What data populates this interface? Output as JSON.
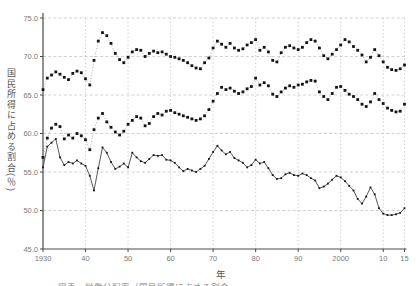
{
  "chart_data": {
    "type": "line",
    "title": "",
    "ylabel": "国民所得に占める割合(％)",
    "xlabel": "年",
    "ylim": [
      45.0,
      75.0
    ],
    "xlim": [
      1930,
      2015
    ],
    "grid": true,
    "legend_position": "none",
    "y_tick_labels": [
      "75.0",
      "70.0",
      "65.0",
      "60.0",
      "55.0",
      "50.0",
      "45.0"
    ],
    "y_tick_values": [
      75,
      70,
      65,
      60,
      55,
      50,
      45
    ],
    "x_tick_labels": [
      "1930",
      "40",
      "50",
      "60",
      "70",
      "80",
      "90",
      "2000",
      "10",
      "15"
    ],
    "x_tick_values": [
      1930,
      1940,
      1950,
      1960,
      1970,
      1980,
      1990,
      2000,
      2010,
      2015
    ],
    "x_start": 1930,
    "x_step": 1,
    "series": [
      {
        "name": "series-top",
        "marker": "square",
        "marker_size": 2.8,
        "line_style": "dotted",
        "values": [
          65.7,
          67.2,
          67.6,
          68.0,
          67.7,
          67.3,
          67.0,
          67.8,
          68.1,
          67.9,
          67.1,
          66.3,
          69.5,
          72.0,
          73.1,
          72.7,
          71.7,
          70.4,
          69.6,
          69.2,
          69.9,
          70.6,
          70.9,
          70.8,
          70.0,
          70.4,
          70.7,
          70.5,
          70.6,
          70.3,
          70.0,
          69.9,
          69.7,
          69.5,
          69.2,
          68.8,
          68.5,
          68.4,
          69.2,
          69.8,
          71.1,
          72.0,
          71.6,
          71.2,
          71.7,
          71.1,
          70.8,
          71.0,
          71.5,
          71.8,
          72.2,
          70.8,
          71.2,
          70.6,
          69.5,
          69.3,
          70.5,
          71.2,
          71.4,
          71.1,
          70.9,
          71.2,
          71.8,
          72.2,
          72.0,
          71.1,
          70.1,
          69.7,
          70.3,
          70.9,
          71.5,
          72.2,
          71.9,
          71.3,
          70.8,
          70.2,
          69.3,
          69.9,
          70.9,
          70.1,
          69.3,
          68.6,
          68.3,
          68.2,
          68.4,
          68.9
        ]
      },
      {
        "name": "series-middle",
        "marker": "square",
        "marker_size": 2.8,
        "line_style": "dotted",
        "values": [
          56.9,
          59.4,
          60.7,
          61.2,
          60.9,
          59.3,
          59.8,
          59.4,
          60.0,
          59.7,
          59.2,
          57.9,
          60.5,
          62.0,
          62.6,
          61.5,
          60.8,
          60.2,
          59.8,
          60.3,
          61.2,
          61.7,
          62.2,
          62.0,
          61.0,
          61.3,
          62.2,
          62.6,
          62.4,
          62.9,
          63.0,
          62.7,
          62.5,
          62.3,
          62.1,
          61.9,
          61.7,
          61.9,
          62.3,
          63.1,
          64.2,
          65.2,
          66.0,
          65.7,
          65.9,
          65.5,
          65.2,
          65.4,
          65.8,
          66.1,
          67.2,
          66.3,
          66.6,
          66.2,
          65.1,
          64.8,
          65.4,
          65.9,
          66.2,
          66.0,
          66.3,
          66.4,
          66.7,
          66.9,
          66.8,
          65.4,
          64.8,
          64.4,
          65.2,
          66.0,
          66.1,
          65.6,
          65.1,
          64.8,
          64.4,
          63.8,
          63.5,
          64.1,
          65.2,
          64.4,
          63.9,
          63.3,
          63.0,
          62.8,
          62.9,
          63.8
        ]
      },
      {
        "name": "series-bottom",
        "marker": "square",
        "marker_size": 1.8,
        "line_style": "solid",
        "values": [
          55.6,
          58.3,
          58.8,
          59.3,
          56.9,
          55.9,
          56.3,
          56.1,
          56.5,
          56.1,
          55.8,
          54.5,
          52.6,
          55.5,
          58.2,
          57.5,
          56.3,
          55.4,
          55.7,
          56.1,
          55.6,
          57.5,
          56.9,
          56.4,
          56.2,
          56.7,
          57.2,
          57.1,
          57.2,
          56.6,
          56.5,
          56.2,
          55.6,
          55.1,
          55.4,
          55.2,
          55.0,
          55.4,
          55.8,
          56.7,
          57.6,
          58.4,
          57.8,
          57.3,
          57.6,
          56.8,
          56.5,
          56.2,
          55.6,
          55.9,
          56.6,
          56.1,
          56.3,
          55.5,
          54.6,
          54.1,
          54.2,
          54.7,
          54.9,
          54.6,
          54.5,
          54.8,
          54.6,
          54.2,
          53.9,
          52.9,
          53.1,
          53.5,
          54.0,
          54.5,
          54.3,
          53.8,
          53.2,
          52.6,
          51.5,
          50.9,
          51.8,
          53.0,
          52.1,
          50.3,
          49.6,
          49.4,
          49.4,
          49.5,
          49.7,
          50.3
        ]
      }
    ]
  },
  "labels": {
    "ylabel": "国民所得に占める割合(％)",
    "xlabel": "年",
    "clipped_caption": "図表　労働分配率（国民所得に占める割合）の推移"
  },
  "colors": {
    "background": "#ffffff",
    "grid": "#c6c6c6",
    "axis": "#4a4a4a",
    "marker": "#141414",
    "dotted_connector": "#999999",
    "solid_line": "#444444",
    "tick_text": "#7a7a7a",
    "label_text": "#555555"
  },
  "layout_px": {
    "plot_left": 43,
    "plot_right": 404.5,
    "plot_top": 18,
    "plot_bottom": 249
  }
}
